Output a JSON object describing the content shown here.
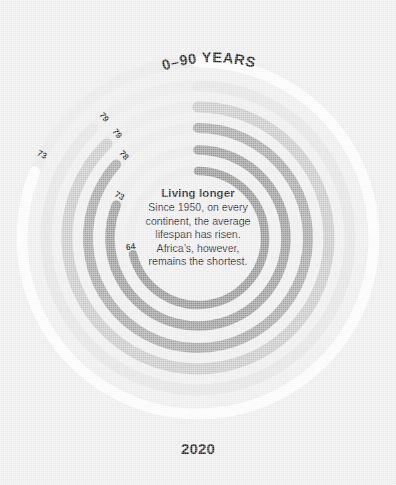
{
  "background": {
    "color": "#eeeeee"
  },
  "header": {
    "scale_title": "0–90 YEARS"
  },
  "footer": {
    "year_label": "2020"
  },
  "annotation": {
    "title": "Living longer",
    "line1": "Since 1950, on every",
    "line2": "continent, the average",
    "line3": "lifespan has risen.",
    "line4": "Africa’s, however,",
    "line5": "remains the shortest."
  },
  "chart_data": {
    "type": "line",
    "subtype": "radial-arc",
    "title": "Living longer",
    "xlabel": "",
    "ylabel": "Years",
    "scale_label": "0–90 YEARS",
    "axis_end_label": "2020",
    "value_range": [
      0,
      90
    ],
    "full_circle_value": 90,
    "start_angle_deg": 0,
    "direction": "clockwise",
    "grid": false,
    "legend": "none",
    "categories": [
      "73",
      "79",
      "79",
      "78",
      "73",
      "64"
    ],
    "values": [
      73,
      79,
      79,
      78,
      73,
      64
    ],
    "series": [
      {
        "name": "ring-1",
        "label": "73",
        "value": 73,
        "radius": 176,
        "thickness": 11,
        "color": "#fdfdfd",
        "label_angle_deg": 292
      },
      {
        "name": "ring-2",
        "label": "79",
        "value": 79,
        "radius": 152,
        "thickness": 11,
        "color": "#e4e4e4",
        "label_angle_deg": 316
      },
      {
        "name": "ring-3",
        "label": "79",
        "value": 79,
        "radius": 131,
        "thickness": 11,
        "color": "#c9c9c9",
        "label_angle_deg": 316
      },
      {
        "name": "ring-4",
        "label": "78",
        "value": 78,
        "radius": 110,
        "thickness": 10,
        "color": "#a6a6a6",
        "label_angle_deg": 312
      },
      {
        "name": "ring-5",
        "label": "73",
        "value": 73,
        "radius": 88,
        "thickness": 9.5,
        "color": "#9a9a9a",
        "label_angle_deg": 292
      },
      {
        "name": "ring-6",
        "label": "64",
        "value": 64,
        "radius": 67,
        "thickness": 8.5,
        "color": "#949494",
        "label_angle_deg": 256
      }
    ],
    "track_color": "#e6e6e6"
  }
}
